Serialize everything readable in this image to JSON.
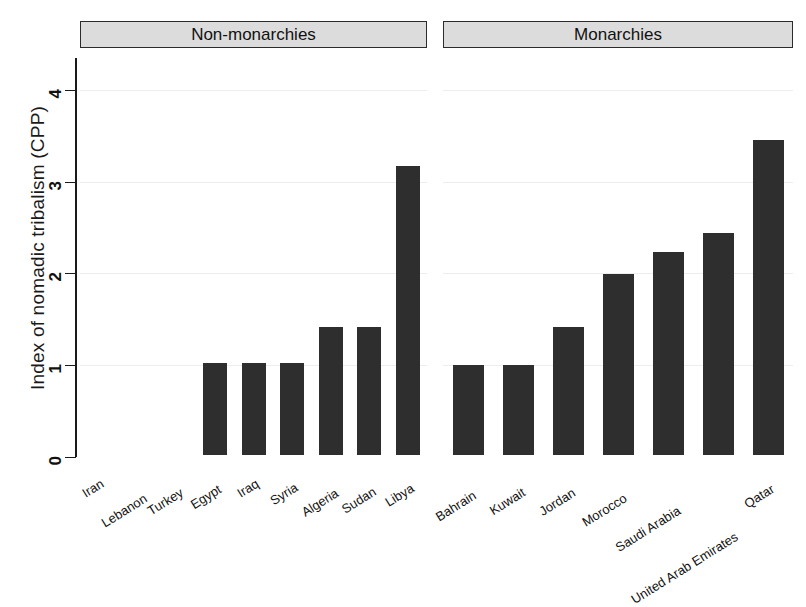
{
  "chart_data": {
    "type": "bar",
    "title": "",
    "subtitle": "",
    "xlabel": "",
    "ylabel": "Index of nomadic tribalism (CPP)",
    "ylim": [
      0,
      4.25
    ],
    "yticks": [
      0,
      1,
      2,
      3,
      4
    ],
    "ytick_labels": [
      "0",
      "1",
      "2",
      "3",
      "4"
    ],
    "grid": true,
    "grid_axis": "y",
    "legend": "none",
    "bar_color": "#2e2e2e",
    "panels": [
      {
        "name": "non-monarchies",
        "label": "Non-monarchies",
        "categories": [
          "Iran",
          "Lebanon",
          "Turkey",
          "Egypt",
          "Iraq",
          "Syria",
          "Algeria",
          "Sudan",
          "Libya"
        ],
        "values": [
          0,
          0,
          0,
          1.0,
          1.0,
          1.0,
          1.4,
          1.4,
          3.15
        ]
      },
      {
        "name": "monarchies",
        "label": "Monarchies",
        "categories": [
          "Bahrain",
          "Kuwait",
          "Jordan",
          "Morocco",
          "Saudi Arabia",
          "United Arab Emirates",
          "Qatar"
        ],
        "values": [
          0.98,
          0.98,
          1.39,
          1.97,
          2.21,
          2.42,
          3.43
        ]
      }
    ]
  },
  "axis": {
    "y_title": "Index of nomadic tribalism (CPP)",
    "ticks": [
      "0",
      "1",
      "2",
      "3",
      "4"
    ]
  },
  "panels": {
    "left_header": "Non-monarchies",
    "right_header": "Monarchies"
  }
}
